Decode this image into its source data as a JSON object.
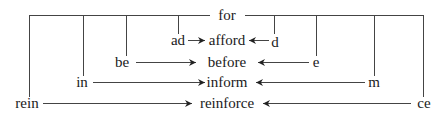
{
  "diagram": {
    "root": "for",
    "rows": [
      {
        "prefix": "ad",
        "word": "afford",
        "suffix": "d"
      },
      {
        "prefix": "be",
        "word": "before",
        "suffix": "e"
      },
      {
        "prefix": "in",
        "word": "inform",
        "suffix": "m"
      },
      {
        "prefix": "rein",
        "word": "reinforce",
        "suffix": "ce"
      }
    ]
  }
}
